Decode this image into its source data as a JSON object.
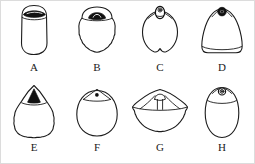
{
  "figure": {
    "kind": "specimen-plate",
    "panel_count": 8,
    "background_color": "#ffffff",
    "line_color": "#1b1b1b",
    "fill_color": "#111111",
    "border_color": "#dcdcdc"
  },
  "panels": [
    {
      "label": "A",
      "position": "row1-col1",
      "body_shape": "rounded-rectangular / barrel",
      "margin": "smooth",
      "apical_feature": "wide dark lens-shaped operculum spanning the apex",
      "apical_feature_name": "dark-lens-operculum"
    },
    {
      "label": "B",
      "position": "row1-col2",
      "body_shape": "broad rounded / sub-circular",
      "margin": "crenulate (scalloped lower margin)",
      "apical_feature": "dark trapezoidal operculum set in a flat apical collar",
      "apical_feature_name": "dark-trapezoid-operculum"
    },
    {
      "label": "C",
      "position": "row1-col3",
      "body_shape": "cordate / heart-shaped with notched base",
      "margin": "smooth",
      "apical_feature": "small oval apical neck with internal pore ring",
      "apical_feature_name": "oval-apical-neck"
    },
    {
      "label": "D",
      "position": "row1-col4",
      "body_shape": "sub-triangular with rounded base",
      "margin": "smooth",
      "apical_feature": "prominent dark annular pore with pale centre",
      "apical_feature_name": "dark-annular-pore"
    },
    {
      "label": "E",
      "position": "row2-col1",
      "body_shape": "pyriform with pointed apex",
      "margin": "crenulate (scalloped)",
      "apical_feature": "solid black triangular operculum in a triangular apical hood",
      "apical_feature_name": "black-triangular-operculum"
    },
    {
      "label": "F",
      "position": "row2-col2",
      "body_shape": "circular / globose",
      "margin": "smooth",
      "apical_feature": "low triangular apical cap with a minute dark pore",
      "apical_feature_name": "triangular-cap-with-pore"
    },
    {
      "label": "G",
      "position": "row2-col3",
      "body_shape": "broad fan / flattened cone in lateral view",
      "margin": "crenulate (scalloped distal margin)",
      "apical_feature": "small domed apical boss with radiating sutures",
      "apical_feature_name": "domed-apical-boss"
    },
    {
      "label": "H",
      "position": "row2-col4",
      "body_shape": "ovate / egg-shaped",
      "margin": "smooth",
      "apical_feature": "small circular apical pore ring on a low apical collar",
      "apical_feature_name": "circular-apical-pore-ring"
    }
  ]
}
